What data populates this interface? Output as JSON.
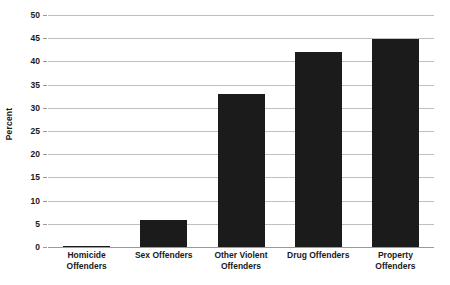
{
  "chart_data": {
    "type": "bar",
    "title": "",
    "subtitle": "",
    "xlabel": "",
    "ylabel": "Percent",
    "ylim": [
      0,
      50
    ],
    "ytick_step": 5,
    "yticks": [
      0,
      5,
      10,
      15,
      20,
      25,
      30,
      35,
      40,
      45,
      50
    ],
    "ytick_labels": [
      "0",
      "5",
      "10",
      "15",
      "20",
      "25",
      "30",
      "35",
      "40",
      "45",
      "50"
    ],
    "categories": [
      "Homicide\nOffenders",
      "Sex Offenders",
      "Other Violent\nOffenders",
      "Drug Offenders",
      "Property\nOffenders"
    ],
    "values": [
      0.2,
      5.8,
      33.0,
      42.0,
      44.8
    ],
    "grid": true,
    "grid_axis": "y",
    "legend": false,
    "legend_position": "none",
    "bar_color": "#1b1b1b",
    "gridline_color": "#bfbfbf",
    "axis_color": "#9a9a9a",
    "background_color": "#ffffff",
    "annotations": []
  },
  "axis": {
    "y_title": "Percent"
  }
}
